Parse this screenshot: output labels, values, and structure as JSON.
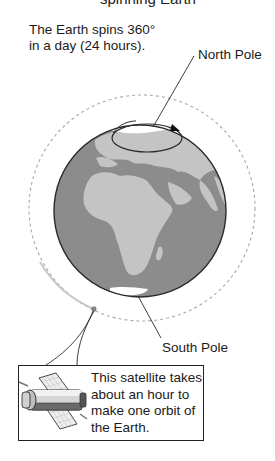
{
  "diagram": {
    "top_cut_text": "spinning Earth",
    "intro_text_line1": "The Earth spins 360°",
    "intro_text_line2": "in a day (24 hours).",
    "labels": {
      "north_pole": "North Pole",
      "south_pole": "South Pole"
    },
    "caption": {
      "line1": "This satellite takes",
      "line2": "about an hour to",
      "line3": "make one orbit of",
      "line4": "the Earth."
    },
    "icons": [
      "globe-earth",
      "rotation-arrow",
      "satellite",
      "orbit-path"
    ],
    "colors": {
      "ocean": "#8c8c8c",
      "land": "#c4c4c4",
      "ice": "#ffffff",
      "orbit": "#aaaaaa",
      "outline": "#2a2a2a"
    }
  }
}
